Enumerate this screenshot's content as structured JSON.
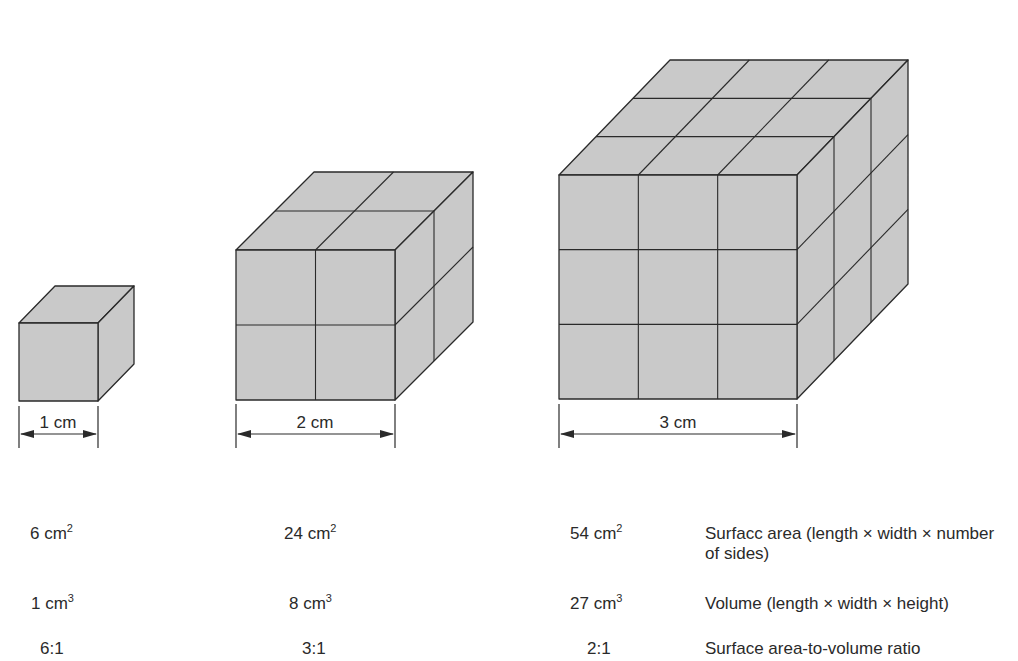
{
  "figure": {
    "fill_color": "#c9c9c9",
    "line_color": "#2a2a2a",
    "cubes": [
      {
        "id": "cube-1",
        "units_per_edge": 1,
        "edge_label": "1 cm"
      },
      {
        "id": "cube-2",
        "units_per_edge": 2,
        "edge_label": "2 cm"
      },
      {
        "id": "cube-3",
        "units_per_edge": 3,
        "edge_label": "3 cm"
      }
    ]
  },
  "table": {
    "rows": [
      {
        "description": "Surfacc area (length × width × number of sides)",
        "values": [
          {
            "num": "6 cm",
            "exp": "2"
          },
          {
            "num": "24 cm",
            "exp": "2"
          },
          {
            "num": "54 cm",
            "exp": "2"
          }
        ]
      },
      {
        "description": "Volume (length × width × height)",
        "values": [
          {
            "num": "1 cm",
            "exp": "3"
          },
          {
            "num": "8 cm",
            "exp": "3"
          },
          {
            "num": "27 cm",
            "exp": "3"
          }
        ]
      },
      {
        "description": "Surface area-to-volume ratio",
        "values": [
          {
            "num": "6:1",
            "exp": ""
          },
          {
            "num": "3:1",
            "exp": ""
          },
          {
            "num": "2:1",
            "exp": ""
          }
        ]
      }
    ]
  }
}
